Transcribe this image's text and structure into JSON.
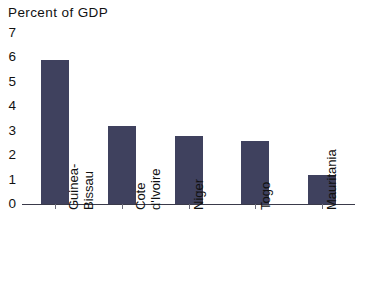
{
  "chart_data": {
    "type": "bar",
    "title": "Percent of GDP",
    "xlabel": "",
    "ylabel": "",
    "ylim": [
      0,
      7
    ],
    "grid": false,
    "legend": null,
    "categories": [
      "Guinea-Bissau",
      "Cote d'Ivoire",
      "Niger",
      "Togo",
      "Mauritania"
    ],
    "category_lines": [
      [
        "Guinea-",
        "Bissau"
      ],
      [
        "Cote",
        "d'Ivoire"
      ],
      [
        "Niger"
      ],
      [
        "Togo"
      ],
      [
        "Mauritania"
      ]
    ],
    "values": [
      5.9,
      3.2,
      2.8,
      2.6,
      1.2
    ],
    "y_ticks": [
      "7",
      "6",
      "5",
      "4",
      "3",
      "2",
      "1",
      "0"
    ],
    "bar_color": "#3f415e",
    "axis_color": "#3a3a4a"
  }
}
